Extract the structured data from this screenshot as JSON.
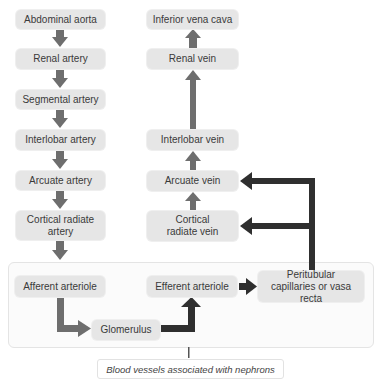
{
  "diagram": {
    "arteries": [
      {
        "label": "Abdominal aorta"
      },
      {
        "label": "Renal artery"
      },
      {
        "label": "Segmental artery"
      },
      {
        "label": "Interlobar artery"
      },
      {
        "label": "Arcuate artery"
      },
      {
        "label": "Cortical radiate artery"
      }
    ],
    "veins": [
      {
        "label": "Inferior vena cava"
      },
      {
        "label": "Renal vein"
      },
      {
        "label": "Interlobar vein"
      },
      {
        "label": "Arcuate vein"
      },
      {
        "label": "Cortical radiate vein"
      }
    ],
    "nephron": {
      "afferent": "Afferent arteriole",
      "glomerulus": "Glomerulus",
      "efferent": "Efferent arteriole",
      "peritubular": "Peritubular capillaries or vasa recta"
    },
    "caption": "Blood vessels associated with nephrons",
    "colors": {
      "box_fill": "#e6e6e6",
      "arrow_gray": "#6e6e6e",
      "arrow_dark": "#2f2f2f"
    }
  }
}
